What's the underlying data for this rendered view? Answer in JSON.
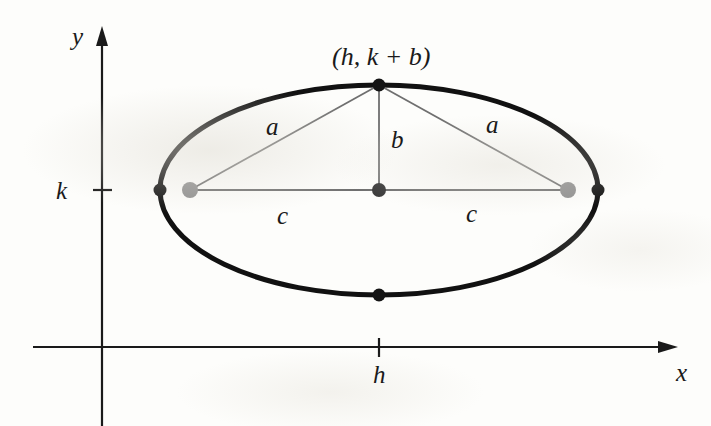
{
  "figure": {
    "type": "geometry-diagram",
    "background_color": "#fdfdfb",
    "ink_color": "#1a1a1a",
    "focus_dot_color": "#8c8c8c",
    "thin_line_color": "#6f6f6f",
    "axes": {
      "x_axis_label": "x",
      "y_axis_label": "y",
      "x_tick_label": "h",
      "y_tick_label": "k",
      "origin": {
        "x": 102,
        "y": 347
      },
      "x_axis": {
        "x1": 33,
        "x2": 678,
        "y": 347,
        "arrow": "right"
      },
      "y_axis": {
        "x": 102,
        "y1": 26,
        "y2": 426,
        "arrow": "up"
      },
      "x_tick": {
        "x": 379,
        "y": 347
      },
      "y_tick": {
        "x": 102,
        "y": 190
      }
    },
    "ellipse": {
      "center": {
        "x": 379,
        "y": 190
      },
      "rx": 219,
      "ry": 105,
      "stroke_width": 5
    },
    "points": [
      {
        "name": "top-vertex",
        "x": 379,
        "y": 85,
        "color": "#141414",
        "radius": 6.5,
        "kind": "co-vertex"
      },
      {
        "name": "bottom-vertex",
        "x": 379,
        "y": 295,
        "color": "#141414",
        "radius": 6.5,
        "kind": "co-vertex"
      },
      {
        "name": "left-vertex",
        "x": 160,
        "y": 190,
        "color": "#141414",
        "radius": 6.5,
        "kind": "vertex"
      },
      {
        "name": "right-vertex",
        "x": 598,
        "y": 190,
        "color": "#141414",
        "radius": 6.5,
        "kind": "vertex"
      },
      {
        "name": "center-point",
        "x": 379,
        "y": 190,
        "color": "#3a3a3a",
        "radius": 7,
        "kind": "center"
      },
      {
        "name": "left-focus",
        "x": 190,
        "y": 190,
        "color": "#8f8f8f",
        "radius": 8,
        "kind": "focus"
      },
      {
        "name": "right-focus",
        "x": 568,
        "y": 190,
        "color": "#8f8f8f",
        "radius": 8,
        "kind": "focus"
      }
    ],
    "segments": [
      {
        "name": "segment-a-left",
        "label": "a",
        "x1": 190,
        "y1": 190,
        "x2": 379,
        "y2": 85
      },
      {
        "name": "segment-a-right",
        "label": "a",
        "x1": 568,
        "y1": 190,
        "x2": 379,
        "y2": 85
      },
      {
        "name": "segment-b",
        "label": "b",
        "x1": 379,
        "y1": 85,
        "x2": 379,
        "y2": 190
      },
      {
        "name": "segment-c-left",
        "label": "c",
        "x1": 190,
        "y1": 190,
        "x2": 379,
        "y2": 190
      },
      {
        "name": "segment-c-right",
        "label": "c",
        "x1": 379,
        "y1": 190,
        "x2": 568,
        "y2": 190
      }
    ],
    "labels": {
      "top_point": "(h, k + b)",
      "a_left": "a",
      "a_right": "a",
      "b": "b",
      "c_left": "c",
      "c_right": "c",
      "h": "h",
      "k": "k",
      "x": "x",
      "y": "y"
    }
  }
}
